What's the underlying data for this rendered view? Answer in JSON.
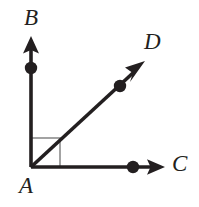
{
  "figure": {
    "kind": "geometry-diagram",
    "background_color": "#ffffff",
    "stroke_color": "#231f20",
    "right_angle_marker_color": "#8c8c8c",
    "canvas": {
      "width": 199,
      "height": 207
    }
  },
  "labels": {
    "vertex": "A",
    "up": "B",
    "diagonal": "D",
    "right": "C"
  },
  "points": {
    "A": {
      "x": 31,
      "y": 167,
      "label": "A",
      "is_vertex": true
    },
    "B_dot": {
      "x": 31,
      "y": 68
    },
    "C_dot": {
      "x": 133,
      "y": 167
    },
    "D_dot": {
      "x": 120,
      "y": 86
    }
  },
  "rays": [
    {
      "name": "ray-AB",
      "from": "A",
      "toward": "B",
      "tip": {
        "x": 31,
        "y": 38
      },
      "has_arrowhead": true,
      "has_point_marker": true
    },
    {
      "name": "ray-AD",
      "from": "A",
      "toward": "D",
      "tip": {
        "x": 144,
        "y": 62
      },
      "has_arrowhead": true,
      "has_point_marker": true
    },
    {
      "name": "ray-AC",
      "from": "A",
      "toward": "C",
      "tip": {
        "x": 164,
        "y": 167
      },
      "has_arrowhead": true,
      "has_point_marker": true
    }
  ],
  "right_angle_marker": {
    "name": "right-angle-square",
    "at": "A",
    "between": [
      "ray-AB",
      "ray-AC"
    ],
    "size": 29,
    "color": "#8c8c8c"
  }
}
